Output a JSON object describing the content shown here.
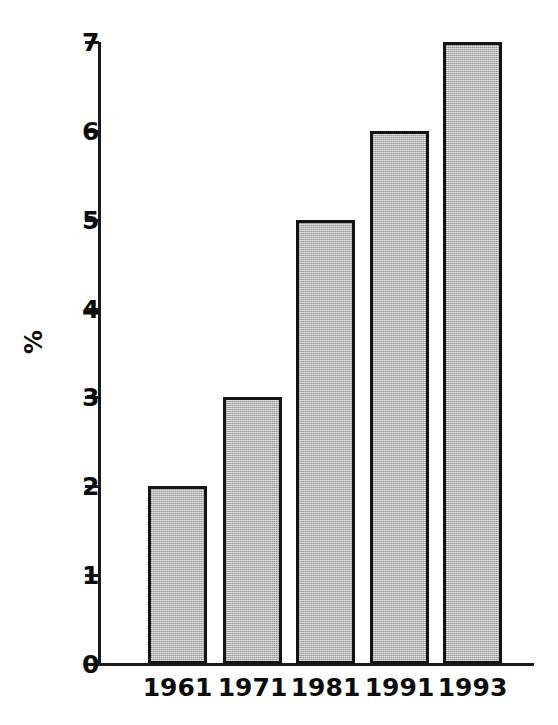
{
  "chart_data": {
    "type": "bar",
    "title": "",
    "subtitle": "",
    "xlabel": "",
    "ylabel": "%",
    "categories": [
      "1961",
      "1971",
      "1981",
      "1991",
      "1993"
    ],
    "values": [
      2,
      3,
      5,
      6,
      7
    ],
    "series": [
      {
        "name": "%",
        "values": [
          2,
          3,
          5,
          6,
          7
        ]
      }
    ],
    "ylim": [
      0,
      7
    ],
    "xlim": null,
    "ytick_labels": [
      "0",
      "1",
      "2",
      "3",
      "4",
      "5",
      "6",
      "7"
    ],
    "ytick_values": [
      0,
      1,
      2,
      3,
      4,
      5,
      6,
      7
    ],
    "xtick_labels": [
      "1961",
      "1971",
      "1981",
      "1991",
      "1993"
    ],
    "grid": false,
    "legend": false,
    "legend_position": "none",
    "annotations": [],
    "colors": {
      "bar_fill": "#b4b4b4",
      "bar_border": "#141414",
      "axis": "#1a1a1a",
      "text": "#0d0d0d",
      "background": "#ffffff"
    }
  },
  "axes": {
    "y": {
      "title": "%",
      "ticks": [
        {
          "label": "7",
          "value": 7
        },
        {
          "label": "6",
          "value": 6
        },
        {
          "label": "5",
          "value": 5
        },
        {
          "label": "4",
          "value": 4
        },
        {
          "label": "3",
          "value": 3
        },
        {
          "label": "2",
          "value": 2
        },
        {
          "label": "1",
          "value": 1
        },
        {
          "label": "0",
          "value": 0
        }
      ]
    },
    "x": {
      "title": "",
      "ticks": [
        {
          "label": "1961"
        },
        {
          "label": "1971"
        },
        {
          "label": "1981"
        },
        {
          "label": "1991"
        },
        {
          "label": "1993"
        }
      ]
    }
  },
  "bars": [
    {
      "label": "1961",
      "value": 2
    },
    {
      "label": "1971",
      "value": 3
    },
    {
      "label": "1981",
      "value": 5
    },
    {
      "label": "1991",
      "value": 6
    },
    {
      "label": "1993",
      "value": 7
    }
  ]
}
